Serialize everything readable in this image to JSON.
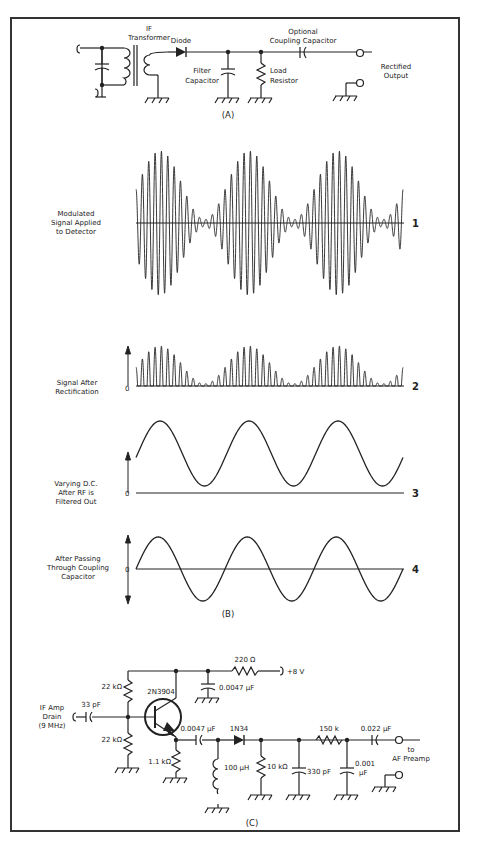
{
  "figure": {
    "border_color": "#333333",
    "line_color": "#222222"
  },
  "part_a": {
    "label": "(A)",
    "components": {
      "if_transformer": [
        "IF",
        "Transformer"
      ],
      "diode": "Diode",
      "filter_capacitor": [
        "Filter",
        "Capacitor"
      ],
      "load_resistor": [
        "Load",
        "Resistor"
      ],
      "coupling_capacitor": [
        "Optional",
        "Coupling Capacitor"
      ],
      "output": [
        "Rectified",
        "Output"
      ]
    }
  },
  "part_b": {
    "label": "(B)",
    "waveforms": [
      {
        "number": "1",
        "caption": [
          "Modulated",
          "Signal Applied",
          "to Detector"
        ],
        "zero_label": ""
      },
      {
        "number": "2",
        "caption": [
          "Signal After",
          "Rectification"
        ],
        "zero_label": "0"
      },
      {
        "number": "3",
        "caption": [
          "Varying D.C.",
          "After RF is",
          "Filtered Out"
        ],
        "zero_label": "0"
      },
      {
        "number": "4",
        "caption": [
          "After Passing",
          "Through Coupling",
          "Capacitor"
        ],
        "zero_label": "0"
      }
    ]
  },
  "part_c": {
    "label": "(C)",
    "input": [
      "IF Amp",
      "Drain",
      "(9 MHz)"
    ],
    "components": {
      "c_in": "33 pF",
      "r_bias_top": "22 kΩ",
      "r_bias_bottom": "22 kΩ",
      "transistor": "2N3904",
      "r_emitter": "1.1 kΩ",
      "r_supply": "220 Ω",
      "supply": "+8 V",
      "c_bypass": "0.0047 µF",
      "c_couple": "0.0047 µF",
      "inductor": "100 µH",
      "diode": "1N34",
      "r_load": "10 kΩ",
      "c_filter": "330 pF",
      "r_series": "150 k",
      "c_shunt": [
        "0.001",
        "µF"
      ],
      "c_out": "0.022 µF"
    },
    "output": [
      "to",
      "AF Preamp"
    ]
  },
  "chart_data": {
    "type": "line",
    "series": [
      {
        "name": "Modulated Signal Applied to Detector",
        "kind": "am_carrier",
        "envelope_cycles": 3,
        "carrier_cycles_per_envelope": 14,
        "modulation_depth": 0.9,
        "x": [
          0,
          1
        ],
        "ylim": [
          -1,
          1
        ]
      },
      {
        "name": "Signal After Rectification",
        "kind": "half_wave_rectified",
        "envelope_cycles": 3,
        "carrier_cycles_per_envelope": 14,
        "modulation_depth": 0.9,
        "ylim": [
          0,
          1
        ]
      },
      {
        "name": "Varying D.C. After RF is Filtered Out",
        "kind": "sine_offset",
        "cycles": 3,
        "dc_offset": 0.55,
        "amplitude": 0.45,
        "ylim": [
          0,
          1
        ]
      },
      {
        "name": "After Passing Through Coupling Capacitor",
        "kind": "sine",
        "cycles": 3,
        "amplitude": 1.0,
        "ylim": [
          -1,
          1
        ]
      }
    ],
    "xlabel": "",
    "ylabel": "",
    "grid": false
  }
}
